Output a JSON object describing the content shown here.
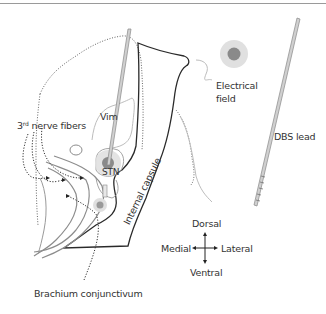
{
  "figure": {
    "type": "anatomical-diagram"
  },
  "labels": {
    "third_nerve_prefix": "3",
    "third_nerve_sup": "rd",
    "third_nerve_suffix": " nerve fibers",
    "vim": "Vim",
    "stn": "STN",
    "internal_capsule": "Internal capsule",
    "brachium": "Brachium conjunctivum",
    "electrical_field_line1": "Electrical",
    "electrical_field_line2": "field",
    "dbs_lead": "DBS lead"
  },
  "orientation": {
    "up": "Dorsal",
    "down": "Ventral",
    "left": "Medial",
    "right": "Lateral"
  },
  "legend": [
    {
      "symbol": "electrical-field-circle",
      "label": "Electrical field"
    },
    {
      "symbol": "dbs-lead-bar",
      "label": "DBS lead"
    }
  ],
  "colors": {
    "outline_dark": "#2a2a2a",
    "outline_gray": "#bdbdbd",
    "dotted": "#555555",
    "fiber_gray": "#8c8c8c",
    "field_outer": "#e0e0e0",
    "field_inner": "#8a8a8a",
    "lead_fill": "#d0d0d0",
    "text": "#333333"
  }
}
